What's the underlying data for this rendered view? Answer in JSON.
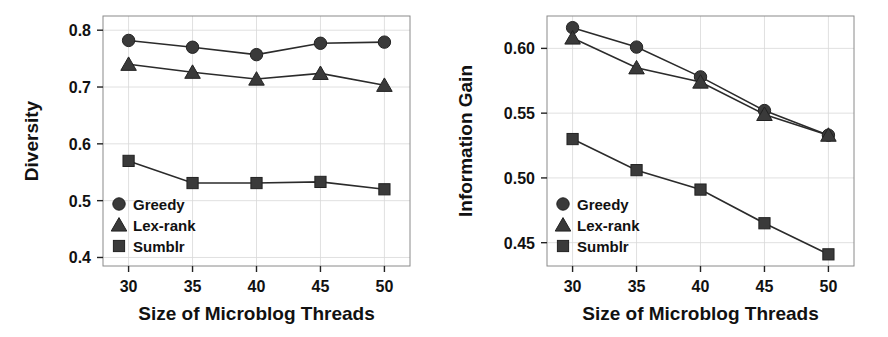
{
  "figure": {
    "panel_count": 2,
    "background": "#ffffff",
    "marker_color": "#3a3a3a",
    "line_color": "#2b2b2b",
    "grid_color": "#d8d8d8"
  },
  "legend": {
    "entries": [
      {
        "label": "Greedy",
        "marker": "circle"
      },
      {
        "label": "Lex-rank",
        "marker": "triangle"
      },
      {
        "label": "Sumblr",
        "marker": "square"
      }
    ],
    "position": "lower-left"
  },
  "chart_data": [
    {
      "type": "line",
      "title": "",
      "xlabel": "Size of Microblog Threads",
      "ylabel": "Diversity",
      "x": [
        30,
        35,
        40,
        45,
        50
      ],
      "xticklabels": [
        "30",
        "35",
        "40",
        "45",
        "50"
      ],
      "xlim": [
        28,
        52
      ],
      "ylim": [
        0.385,
        0.825
      ],
      "yticks": [
        0.4,
        0.5,
        0.6,
        0.7,
        0.8
      ],
      "yticklabels": [
        "0.4",
        "0.5",
        "0.6",
        "0.7",
        "0.8"
      ],
      "grid": true,
      "legend": [
        "Greedy",
        "Lex-rank",
        "Sumblr"
      ],
      "series": [
        {
          "name": "Greedy",
          "marker": "circle",
          "values": [
            0.782,
            0.77,
            0.757,
            0.777,
            0.779
          ]
        },
        {
          "name": "Lex-rank",
          "marker": "triangle",
          "values": [
            0.74,
            0.726,
            0.714,
            0.724,
            0.703
          ]
        },
        {
          "name": "Sumblr",
          "marker": "square",
          "values": [
            0.57,
            0.531,
            0.531,
            0.533,
            0.52
          ]
        }
      ]
    },
    {
      "type": "line",
      "title": "",
      "xlabel": "Size of Microblog Threads",
      "ylabel": "Information Gain",
      "x": [
        30,
        35,
        40,
        45,
        50
      ],
      "xticklabels": [
        "30",
        "35",
        "40",
        "45",
        "50"
      ],
      "xlim": [
        28,
        52
      ],
      "ylim": [
        0.432,
        0.625
      ],
      "yticks": [
        0.45,
        0.5,
        0.55,
        0.6
      ],
      "yticklabels": [
        "0.45",
        "0.50",
        "0.55",
        "0.60"
      ],
      "grid": true,
      "legend": [
        "Greedy",
        "Lex-rank",
        "Sumblr"
      ],
      "series": [
        {
          "name": "Greedy",
          "marker": "circle",
          "values": [
            0.616,
            0.601,
            0.578,
            0.552,
            0.533
          ]
        },
        {
          "name": "Lex-rank",
          "marker": "triangle",
          "values": [
            0.608,
            0.585,
            0.574,
            0.549,
            0.533
          ]
        },
        {
          "name": "Sumblr",
          "marker": "square",
          "values": [
            0.53,
            0.506,
            0.491,
            0.465,
            0.441
          ]
        }
      ]
    }
  ]
}
